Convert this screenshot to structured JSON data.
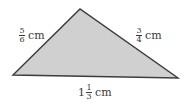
{
  "diagram": {
    "type": "triangle",
    "fill_color": "#d0d0d0",
    "stroke_color": "#3c3c3c",
    "vertices": [
      [
        13,
        75
      ],
      [
        80,
        9
      ],
      [
        178,
        78
      ]
    ],
    "sides": {
      "left": {
        "whole": "",
        "numerator": "5",
        "denominator": "6",
        "unit": "cm"
      },
      "right": {
        "whole": "",
        "numerator": "3",
        "denominator": "4",
        "unit": "cm"
      },
      "bottom": {
        "whole": "1",
        "numerator": "1",
        "denominator": "3",
        "unit": "cm"
      }
    }
  }
}
